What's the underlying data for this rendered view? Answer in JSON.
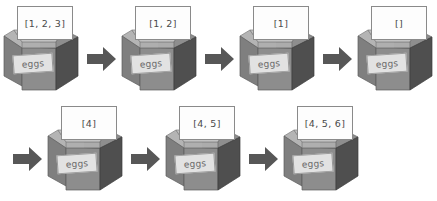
{
  "diagram": {
    "box_label": "eggs",
    "arrow_icon": "right-arrow-icon",
    "colors": {
      "arrow": "#575757",
      "box_front": "#8d8d8d",
      "box_side": "#4f4f4f",
      "box_flap_left": "#b4b4b4",
      "box_flap_right": "#6e6e6e",
      "note_background": "#fdfdfd",
      "note_border": "#8a8a8a",
      "label_background": "#e2e2e2",
      "text": "#4a4a4a"
    },
    "rows": [
      {
        "name": "top-row",
        "steps": [
          {
            "name": "step-1",
            "note": "[1, 2, 3]",
            "box_label": "eggs",
            "arrow_after": true
          },
          {
            "name": "step-2",
            "note": "[1, 2]",
            "box_label": "eggs",
            "arrow_after": true
          },
          {
            "name": "step-3",
            "note": "[1]",
            "box_label": "eggs",
            "arrow_after": true
          },
          {
            "name": "step-4",
            "note": "[]",
            "box_label": "eggs",
            "arrow_after": false
          }
        ]
      },
      {
        "name": "bottom-row",
        "leading_arrow": true,
        "steps": [
          {
            "name": "step-5",
            "note": "[4]",
            "box_label": "eggs",
            "arrow_after": true
          },
          {
            "name": "step-6",
            "note": "[4, 5]",
            "box_label": "eggs",
            "arrow_after": true
          },
          {
            "name": "step-7",
            "note": "[4, 5, 6]",
            "box_label": "eggs",
            "arrow_after": false
          }
        ]
      }
    ]
  }
}
